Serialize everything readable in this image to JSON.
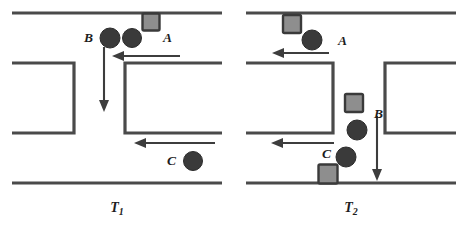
{
  "figure": {
    "background_color": "#ffffff",
    "line_color": "#4a4a4a",
    "arrow_color": "#3d3d3d",
    "circle_color": "#3a3a3a",
    "square_fill_color": "#8e8e8e",
    "square_border_color": "#3a3a3a",
    "label_color": "#1d1d1d"
  },
  "panels": [
    {
      "id": "T1",
      "caption_main": "T",
      "caption_sub": "1",
      "caption_text": "T1",
      "roads": {
        "horizontal_lines": [
          {
            "name": "top-outer-curb",
            "x1": 12,
            "y1": 13,
            "x2": 222,
            "y2": 13
          },
          {
            "name": "bottom-outer-curb",
            "x1": 12,
            "y1": 183,
            "x2": 222,
            "y2": 183
          }
        ],
        "left_block": {
          "name": "left-corner-block",
          "x": 12,
          "y": 63,
          "w": 62,
          "h": 70
        },
        "right_block": {
          "name": "right-corner-block",
          "x": 125,
          "y": 63,
          "w": 97,
          "h": 70
        }
      },
      "arrows": [
        {
          "name": "arrow-upper-westbound",
          "direction": "left",
          "x1": 180,
          "y1": 56,
          "x2": 114,
          "y2": 56
        },
        {
          "name": "arrow-southbound",
          "direction": "down",
          "x1": 104,
          "y1": 47,
          "x2": 104,
          "y2": 110
        },
        {
          "name": "arrow-lower-westbound",
          "direction": "left",
          "x1": 215,
          "y1": 143,
          "x2": 135,
          "y2": 143
        }
      ],
      "vehicles": [
        {
          "name": "vehicle-A-square",
          "label": "A",
          "shape": "square",
          "cx": 151,
          "cy": 22,
          "size": 17,
          "label_x": 163,
          "label_y": 42
        },
        {
          "name": "vehicle-A-circle",
          "label": "",
          "shape": "circle",
          "cx": 132,
          "cy": 38,
          "r": 9.5
        },
        {
          "name": "vehicle-B-circle",
          "label": "B",
          "shape": "circle",
          "cx": 110,
          "cy": 38,
          "r": 10,
          "label_x": 84,
          "label_y": 42
        },
        {
          "name": "vehicle-C-circle",
          "label": "C",
          "shape": "circle",
          "cx": 193,
          "cy": 161,
          "r": 9.5,
          "label_x": 167,
          "label_y": 165
        }
      ]
    },
    {
      "id": "T2",
      "caption_main": "T",
      "caption_sub": "2",
      "caption_text": "T2",
      "roads": {
        "horizontal_lines": [
          {
            "name": "top-outer-curb",
            "x1": 12,
            "y1": 13,
            "x2": 222,
            "y2": 13
          },
          {
            "name": "bottom-outer-curb",
            "x1": 12,
            "y1": 183,
            "x2": 222,
            "y2": 183
          }
        ],
        "left_block": {
          "name": "left-corner-block",
          "x": 12,
          "y": 63,
          "w": 87,
          "h": 70
        },
        "right_block": {
          "name": "right-corner-block",
          "x": 151,
          "y": 63,
          "w": 71,
          "h": 70
        }
      },
      "arrows": [
        {
          "name": "arrow-upper-westbound",
          "direction": "left",
          "x1": 95,
          "y1": 53,
          "x2": 39,
          "y2": 53
        },
        {
          "name": "arrow-lower-westbound",
          "direction": "left",
          "x1": 100,
          "y1": 143,
          "x2": 38,
          "y2": 143
        },
        {
          "name": "arrow-southbound",
          "direction": "down",
          "x1": 143,
          "y1": 116,
          "x2": 143,
          "y2": 180
        }
      ],
      "vehicles": [
        {
          "name": "vehicle-A-square",
          "label": "",
          "shape": "square",
          "cx": 58,
          "cy": 24,
          "size": 18
        },
        {
          "name": "vehicle-A-circle",
          "label": "A",
          "shape": "circle",
          "cx": 78,
          "cy": 40,
          "r": 10,
          "label_x": 104,
          "label_y": 45
        },
        {
          "name": "vehicle-B-square",
          "label": "",
          "shape": "square",
          "cx": 120,
          "cy": 103,
          "size": 18
        },
        {
          "name": "vehicle-B-circle",
          "label": "B",
          "shape": "circle",
          "cx": 123,
          "cy": 130,
          "r": 10,
          "label_x": 140,
          "label_y": 118
        },
        {
          "name": "vehicle-C-circle",
          "label": "C",
          "shape": "circle",
          "cx": 112,
          "cy": 157,
          "r": 10,
          "label_x": 88,
          "label_y": 158
        },
        {
          "name": "vehicle-C-square",
          "label": "",
          "shape": "square",
          "cx": 94,
          "cy": 174,
          "size": 19
        }
      ]
    }
  ]
}
